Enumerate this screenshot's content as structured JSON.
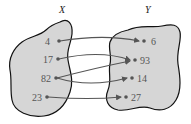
{
  "diagram": {
    "title": "",
    "sets": [
      {
        "id": "X",
        "label": "X",
        "elements": [
          "4",
          "17",
          "82",
          "23"
        ]
      },
      {
        "id": "Y",
        "label": "Y",
        "elements": [
          "6",
          "93",
          "14",
          "27"
        ]
      }
    ],
    "mappings": [
      {
        "from": "4",
        "to": "6"
      },
      {
        "from": "17",
        "to": "93"
      },
      {
        "from": "82",
        "to": "93"
      },
      {
        "from": "82",
        "to": "14"
      },
      {
        "from": "23",
        "to": "27"
      }
    ],
    "colors": {
      "blob_fill": "#d6d6d6",
      "blob_stroke": "#111111",
      "arrow": "#555555",
      "dot": "#555555",
      "text": "#555555"
    }
  }
}
